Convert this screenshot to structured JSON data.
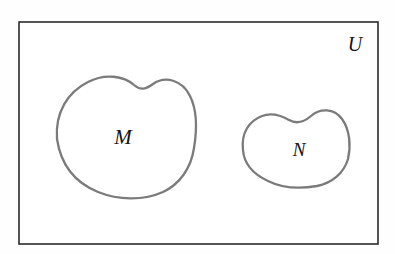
{
  "diagram": {
    "type": "venn-euler-diagram",
    "title": "",
    "background_color": "#fefefe",
    "universe": {
      "label": "U",
      "border_color": "#2b2b2b",
      "fill_color": "#ffffff",
      "x": 19,
      "y": 22,
      "width": 359,
      "height": 222,
      "label_x": 355,
      "label_y": 46
    },
    "sets": [
      {
        "name": "set-m",
        "label": "M",
        "stroke_color": "#7b7b7b",
        "fill_color": "#ffffff",
        "label_x": 123,
        "label_y": 139,
        "bounds": {
          "x": 56,
          "y": 75,
          "width": 140,
          "height": 122
        },
        "path": "M 57 139 C 55 112 68 92 88 82 C 105 73 124 76 134 85 C 141 91 146 89 153 84 C 166 75 183 81 190 96 C 198 112 197 130 194 148 C 191 168 180 184 163 192 C 143 201 118 200 98 192 C 76 183 61 166 57 139 Z"
      },
      {
        "name": "set-n",
        "label": "N",
        "stroke_color": "#7b7b7b",
        "fill_color": "#ffffff",
        "label_x": 299,
        "label_y": 152,
        "bounds": {
          "x": 242,
          "y": 108,
          "width": 108,
          "height": 78
        },
        "path": "M 243 150 C 241 133 249 121 262 116 C 272 112 282 116 289 120 C 296 124 304 122 311 116 C 320 108 334 108 342 119 C 350 130 351 146 348 159 C 344 173 332 183 317 186 C 300 189 282 188 268 181 C 253 174 244 164 243 150 Z"
      }
    ],
    "relationship": "disjoint"
  }
}
